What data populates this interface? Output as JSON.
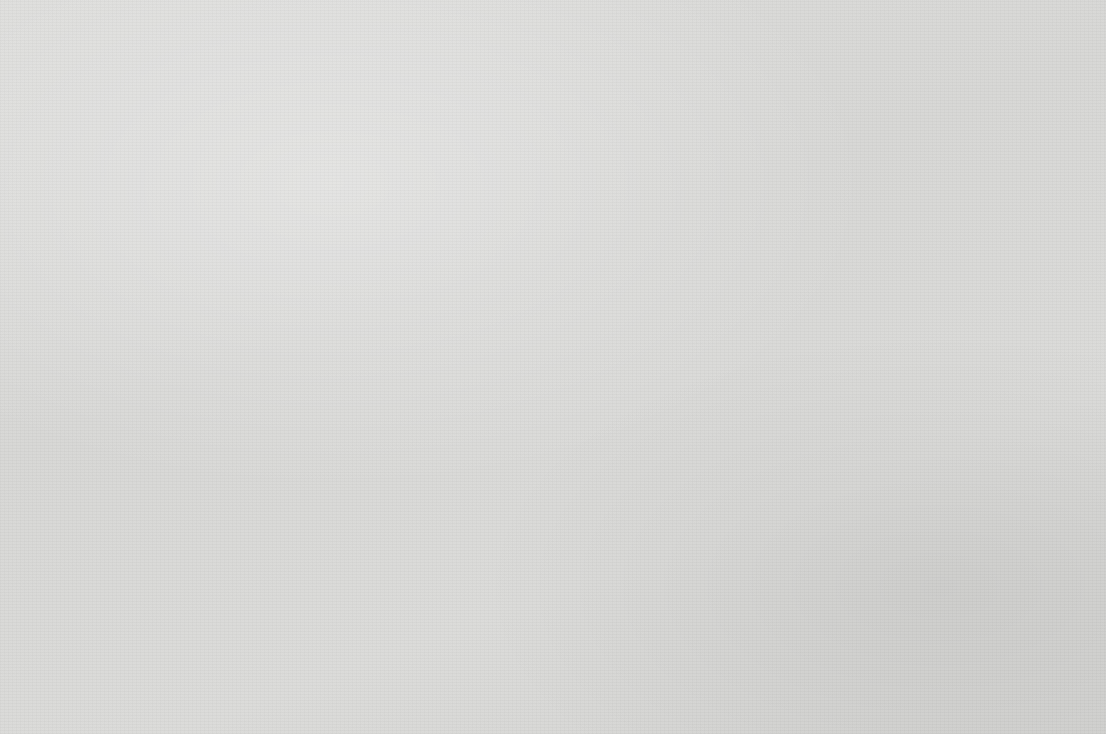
{
  "chart_data": {
    "type": "bar",
    "title": "",
    "xlabel": "",
    "ylabel": "Score",
    "ylim": [
      3.0,
      5.0
    ],
    "ytick_labels": [
      "5.00",
      "4.50",
      "4.00",
      "3.50",
      "3.00"
    ],
    "ytick_values": [
      5.0,
      4.5,
      4.0,
      3.5,
      3.0
    ],
    "grid": "horizontal",
    "legend": "none",
    "categories": [
      "Music",
      "English",
      "Linguistics",
      "Economics",
      "History",
      "Political  Science",
      "Microbiology",
      "Biology",
      "Cell Biology",
      "Chemistry",
      "Computer Science",
      "Genetics",
      "Mathematics",
      "Physics",
      "Statistics",
      "Chemical Eng.",
      "Mechanical Eng.",
      "Nursing"
    ],
    "values": [
      4.78,
      4.4,
      4.62,
      4.77,
      4.57,
      4.54,
      4.7,
      4.1,
      4.25,
      4.51,
      4.55,
      4.66,
      4.28,
      4.53,
      4.7,
      4.49,
      4.32,
      4.54
    ],
    "bar_fill": "checkerboard",
    "bar_edge_color": "#262626",
    "axis_color": "#2a2a2a",
    "background_color": "#d9d9d7"
  }
}
